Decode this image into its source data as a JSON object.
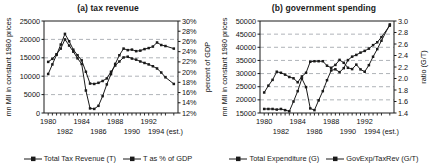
{
  "figure": {
    "background": "#ffffff",
    "line_color": "#1a1a1a",
    "grid_color": "#9aa0a6"
  },
  "panels": [
    {
      "id": "a",
      "title": "(a) tax revenue",
      "left_axis_title": "mn MIl in constant 1980 prices",
      "right_axis_title": "percent of GDP",
      "left_ticks": [
        "0",
        "5000",
        "10000",
        "15000",
        "20000",
        "25000"
      ],
      "right_ticks": [
        "12%",
        "14%",
        "16%",
        "18%",
        "20%",
        "22%",
        "24%",
        "26%",
        "28%",
        "30%"
      ],
      "x_ticks_top": [
        "1980",
        "1984",
        "1988",
        "1992"
      ],
      "x_ticks_bottom": [
        "1982",
        "1986",
        "1990",
        "1994 (est.)"
      ],
      "legend": [
        {
          "label": "Total Tax Revenue (T)",
          "marker": "square"
        },
        {
          "label": "T as % of GDP",
          "marker": "square"
        }
      ]
    },
    {
      "id": "b",
      "title": "(b) government spending",
      "left_axis_title": "mn MIl in constant 1980 prices",
      "right_axis_title": "ratio (G/T)",
      "left_ticks": [
        "15000",
        "20000",
        "25000",
        "30000",
        "35000",
        "40000",
        "45000",
        "50000"
      ],
      "right_ticks": [
        "1.4",
        "1.6",
        "1.8",
        "2.0",
        "2.2",
        "2.4",
        "2.6",
        "2.8",
        "3.0"
      ],
      "x_ticks_top": [
        "1980",
        "1984",
        "1988",
        "1992"
      ],
      "x_ticks_bottom": [
        "1982",
        "1986",
        "1990",
        "1994 (est.)"
      ],
      "legend": [
        {
          "label": "Total Expenditure (G)",
          "marker": "square"
        },
        {
          "label": "GovExp/TaxRev (G/T)",
          "marker": "square"
        }
      ]
    }
  ],
  "chart_data": [
    {
      "type": "line",
      "title": "(a) tax revenue",
      "xlabel": "",
      "ylabel": "mn MIl in constant 1980 prices",
      "y2label": "percent of GDP",
      "grid": true,
      "legend_position": "bottom",
      "xlim": [
        1979.5,
        1995.5
      ],
      "ylim": [
        0,
        25000
      ],
      "y2lim": [
        12,
        30
      ],
      "x": [
        1980,
        1980.5,
        1981,
        1981.5,
        1982,
        1982.5,
        1983,
        1983.5,
        1984,
        1984.5,
        1985,
        1985.5,
        1986,
        1986.5,
        1987,
        1987.5,
        1988,
        1988.5,
        1989,
        1989.5,
        1990,
        1990.5,
        1991,
        1991.5,
        1992,
        1992.5,
        1993,
        1993.5,
        1994,
        1995
      ],
      "x_tick_values": [
        1980,
        1984,
        1988,
        1992
      ],
      "series": [
        {
          "name": "Total Tax Revenue (T)",
          "axis": "left",
          "units": "mn MIl (constant 1980 prices)",
          "values": [
            10600,
            13200,
            15800,
            18600,
            21500,
            19500,
            17200,
            15700,
            14300,
            11200,
            8000,
            7900,
            8200,
            8700,
            9400,
            11200,
            12900,
            14000,
            15100,
            15300,
            14800,
            14500,
            14000,
            13600,
            13200,
            12700,
            12100,
            11000,
            9700,
            7900
          ]
        },
        {
          "name": "T as % of GDP",
          "axis": "right",
          "units": "percent of GDP",
          "values": [
            22.0,
            22.6,
            23.5,
            24.6,
            26.4,
            25.2,
            24.0,
            22.7,
            21.6,
            16.4,
            12.9,
            12.8,
            13.4,
            15.3,
            17.6,
            19.6,
            21.6,
            23.3,
            24.6,
            24.3,
            24.4,
            24.1,
            24.2,
            24.5,
            24.7,
            25.0,
            25.8,
            25.3,
            25.1,
            24.6
          ]
        }
      ]
    },
    {
      "type": "line",
      "title": "(b) government spending",
      "xlabel": "",
      "ylabel": "mn MIl in constant 1980 prices",
      "y2label": "ratio (G/T)",
      "grid": true,
      "legend_position": "bottom",
      "xlim": [
        1979.5,
        1995.5
      ],
      "ylim": [
        15000,
        50000
      ],
      "y2lim": [
        1.4,
        3.0
      ],
      "x": [
        1980,
        1980.5,
        1981,
        1981.5,
        1982,
        1982.5,
        1983,
        1983.5,
        1984,
        1984.5,
        1985,
        1985.5,
        1986,
        1986.5,
        1987,
        1987.5,
        1988,
        1988.5,
        1989,
        1989.5,
        1990,
        1990.5,
        1991,
        1991.5,
        1992,
        1992.5,
        1993,
        1993.5,
        1994,
        1995
      ],
      "x_tick_values": [
        1980,
        1984,
        1988,
        1992
      ],
      "series": [
        {
          "name": "Total Expenditure (G)",
          "axis": "left",
          "units": "mn MIl (constant 1980 prices)",
          "values": [
            22800,
            25400,
            27600,
            30700,
            30300,
            29600,
            28700,
            28200,
            26700,
            28900,
            30300,
            34500,
            34700,
            34700,
            34700,
            33000,
            32200,
            33300,
            35200,
            34100,
            32200,
            31700,
            33400,
            31600,
            30700,
            33200,
            36400,
            39300,
            42500,
            48700
          ],
          "note": "upper curve; right-hand 1994-95 values approach 48700"
        },
        {
          "name": "GovExp/TaxRev (G/T)",
          "axis": "right",
          "units": "ratio",
          "values": [
            1.47,
            1.47,
            1.47,
            1.46,
            1.47,
            1.45,
            1.43,
            1.6,
            1.78,
            2.0,
            1.85,
            1.48,
            1.45,
            1.62,
            1.78,
            1.97,
            2.14,
            2.16,
            2.11,
            2.18,
            2.32,
            2.38,
            2.41,
            2.45,
            2.48,
            2.52,
            2.58,
            2.63,
            2.72,
            2.92
          ]
        }
      ]
    }
  ]
}
